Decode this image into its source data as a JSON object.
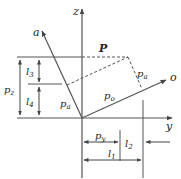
{
  "diagram": {
    "axes": {
      "z": {
        "label": "z"
      },
      "y": {
        "label": "y"
      },
      "a": {
        "label": "a"
      },
      "o": {
        "label": "o"
      }
    },
    "vector": {
      "label": "P"
    },
    "components": {
      "pa_top": {
        "label": "p",
        "sub": "a"
      },
      "pa_left": {
        "label": "p",
        "sub": "a"
      },
      "po": {
        "label": "p",
        "sub": "o"
      },
      "pz": {
        "label": "p",
        "sub": "z"
      },
      "py": {
        "label": "p",
        "sub": "y"
      }
    },
    "dimensions": {
      "l1": {
        "label": "l",
        "sub": "1"
      },
      "l2": {
        "label": "l",
        "sub": "2"
      },
      "l3": {
        "label": "l",
        "sub": "3"
      },
      "l4": {
        "label": "l",
        "sub": "4"
      }
    },
    "colors": {
      "line": "#555555",
      "text": "#222222",
      "background": "#ffffff"
    }
  }
}
